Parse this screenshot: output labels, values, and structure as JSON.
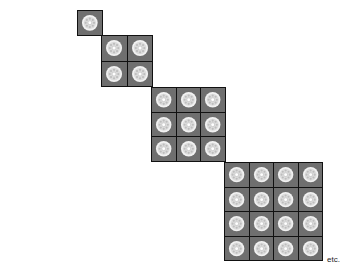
{
  "diagram": {
    "tile_color": "#6f6f6f",
    "border_color": "#111111",
    "gem_color": "#f2f2f2",
    "grids": [
      {
        "size": 1,
        "x": 77,
        "y": 10,
        "px": 26
      },
      {
        "size": 2,
        "x": 101,
        "y": 35,
        "px": 52
      },
      {
        "size": 3,
        "x": 151,
        "y": 87,
        "px": 75
      },
      {
        "size": 4,
        "x": 224,
        "y": 162,
        "px": 99
      }
    ],
    "caption": "etc."
  }
}
